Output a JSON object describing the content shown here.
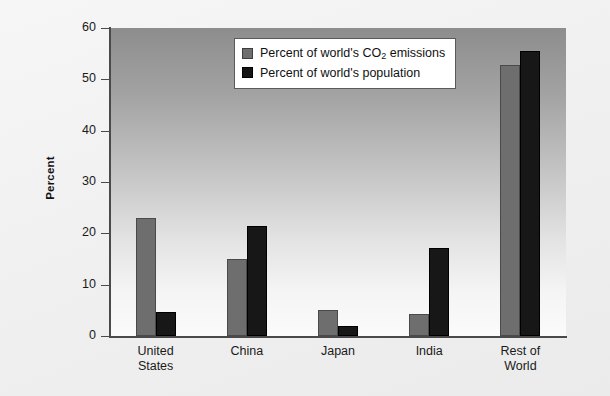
{
  "chart_data": {
    "type": "bar",
    "title": "",
    "xlabel": "",
    "ylabel": "Percent",
    "ylim": [
      0,
      60
    ],
    "yticks": [
      0,
      10,
      20,
      30,
      40,
      50,
      60
    ],
    "grid": false,
    "legend_position": "top-center",
    "categories": [
      "United States",
      "China",
      "Japan",
      "India",
      "Rest of World"
    ],
    "series": [
      {
        "name": "Percent of world's CO2 emissions",
        "name_parts": {
          "pre": "Percent of world's CO",
          "sub": "2",
          "post": " emissions"
        },
        "color": "#6e6e6e",
        "values": [
          23,
          15,
          5,
          4.3,
          52.7
        ]
      },
      {
        "name": "Percent of world's population",
        "name_parts": {
          "pre": "Percent of world's population",
          "sub": "",
          "post": ""
        },
        "color": "#141414",
        "values": [
          4.6,
          21.5,
          2,
          17.2,
          55.5
        ]
      }
    ]
  },
  "axis": {
    "y_title": "Percent",
    "y_tick_labels": [
      "0",
      "10",
      "20",
      "30",
      "40",
      "50",
      "60"
    ],
    "x_tick_labels": [
      "United\nStates",
      "China",
      "Japan",
      "India",
      "Rest of\nWorld"
    ]
  },
  "colors": {
    "series_1": "#6e6e6e",
    "series_2": "#141414",
    "axis": "#4a4a4a",
    "page_background": "#f2f2f2",
    "legend_background": "#ffffff"
  }
}
